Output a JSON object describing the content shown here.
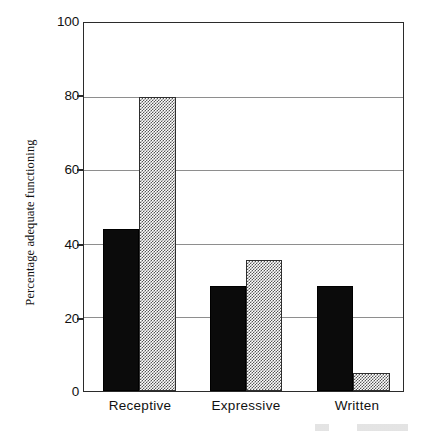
{
  "chart_data": {
    "type": "bar",
    "title": "",
    "subtitle": "",
    "xlabel": "",
    "ylabel": "Percentage adequate functioning",
    "categories": [
      "Receptive",
      "Expressive",
      "Written"
    ],
    "series": [
      {
        "name": "series-1-solid-black",
        "color": "#0b0b0b",
        "fill": "solid",
        "values": [
          44,
          28.5,
          28.5
        ]
      },
      {
        "name": "series-2-hatched-gray",
        "color": "#565656",
        "fill": "checkerboard-hatch",
        "values": [
          80,
          35.5,
          5
        ]
      }
    ],
    "ylim": [
      0,
      100
    ],
    "yticks": [
      0,
      20,
      40,
      60,
      80,
      100
    ],
    "ytick_labels": [
      "0",
      "20",
      "40",
      "60",
      "80",
      "100"
    ],
    "gridlines": [
      20,
      40,
      60,
      80
    ],
    "grid": true,
    "legend": "none",
    "legend_position": "none",
    "annotations": []
  },
  "axes": {
    "y_axis_title": "Percentage adequate functioning",
    "y_tick_labels": [
      "100",
      "80",
      "60",
      "40",
      "20",
      "0"
    ],
    "x_tick_labels": [
      "Receptive",
      "Expressive",
      "Written"
    ]
  }
}
